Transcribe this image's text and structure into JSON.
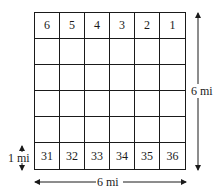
{
  "diagram": {
    "grid": {
      "rows": 6,
      "cols": 6,
      "cells": [
        [
          "6",
          "5",
          "4",
          "3",
          "2",
          "1"
        ],
        [
          "",
          "",
          "",
          "",
          "",
          ""
        ],
        [
          "",
          "",
          "",
          "",
          "",
          ""
        ],
        [
          "",
          "",
          "",
          "",
          "",
          ""
        ],
        [
          "",
          "",
          "",
          "",
          "",
          ""
        ],
        [
          "31",
          "32",
          "33",
          "34",
          "35",
          "36"
        ]
      ]
    },
    "labels": {
      "height": "6 mi",
      "width": "6 mi",
      "section": "1 mi"
    }
  }
}
